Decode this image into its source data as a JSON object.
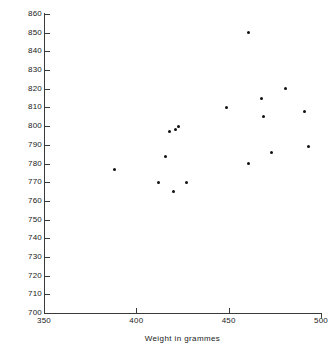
{
  "chart_data": {
    "type": "scatter",
    "title": "",
    "xlabel": "Weight  in grammes",
    "ylabel": "Length in mm",
    "xlim": [
      350,
      500
    ],
    "ylim": [
      700,
      860
    ],
    "xticks": [
      350,
      400,
      450,
      500
    ],
    "yticks": [
      700,
      710,
      720,
      730,
      740,
      750,
      760,
      770,
      780,
      790,
      800,
      810,
      820,
      830,
      840,
      850,
      860
    ],
    "xticklabels": [
      "350",
      "400",
      "450",
      "500"
    ],
    "yticklabels": [
      "700",
      "710",
      "720",
      "730",
      "740",
      "750",
      "760",
      "770",
      "780",
      "790",
      "800",
      "810",
      "820",
      "830",
      "840",
      "850",
      "860"
    ],
    "grid": false,
    "legend": null,
    "marker": "filled-circle",
    "marker_color": "#111111",
    "points": [
      {
        "x": 388,
        "y": 777
      },
      {
        "x": 412,
        "y": 770
      },
      {
        "x": 416,
        "y": 784
      },
      {
        "x": 418,
        "y": 797
      },
      {
        "x": 421,
        "y": 798
      },
      {
        "x": 423,
        "y": 800
      },
      {
        "x": 420,
        "y": 765
      },
      {
        "x": 427,
        "y": 770
      },
      {
        "x": 449,
        "y": 810
      },
      {
        "x": 461,
        "y": 850
      },
      {
        "x": 461,
        "y": 780
      },
      {
        "x": 468,
        "y": 815
      },
      {
        "x": 469,
        "y": 805
      },
      {
        "x": 473,
        "y": 786
      },
      {
        "x": 481,
        "y": 820
      },
      {
        "x": 491,
        "y": 808
      },
      {
        "x": 493,
        "y": 789
      }
    ]
  }
}
